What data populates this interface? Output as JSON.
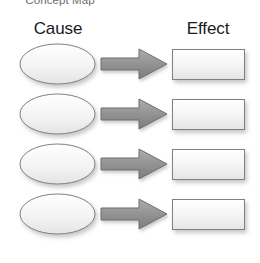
{
  "document": {
    "title": "Concept Map"
  },
  "headers": {
    "left": "Cause",
    "right": "Effect"
  },
  "colors": {
    "shape_fill_top": "#ffffff",
    "shape_fill_bottom": "#e6e6e6",
    "shape_stroke": "#808080",
    "arrow_fill_top": "#a6a6a6",
    "arrow_fill_bottom": "#7f7f7f",
    "arrow_stroke": "#6e6e6e",
    "shadow": "#bfbfbf",
    "heading_text": "#1b1b1b",
    "title_text": "#6e6e6e",
    "background": "#ffffff"
  },
  "diagram": {
    "type": "concept-map",
    "pairs": 4,
    "connector": "block-arrow-right",
    "rows": [
      {
        "cause_label": "",
        "effect_label": "",
        "connector_label": ""
      },
      {
        "cause_label": "",
        "effect_label": "",
        "connector_label": ""
      },
      {
        "cause_label": "",
        "effect_label": "",
        "connector_label": ""
      },
      {
        "cause_label": "",
        "effect_label": "",
        "connector_label": ""
      }
    ]
  }
}
